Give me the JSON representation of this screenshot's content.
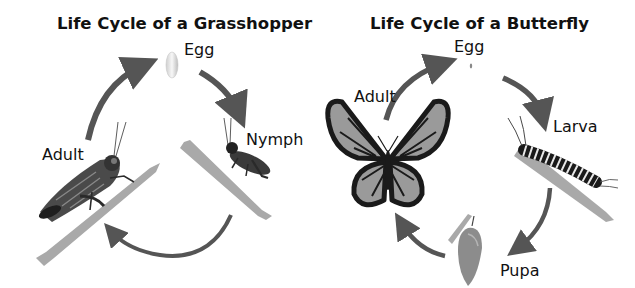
{
  "grasshopper": {
    "title": "Life Cycle of a Grasshopper",
    "stages": {
      "egg": "Egg",
      "nymph": "Nymph",
      "adult": "Adult"
    }
  },
  "butterfly": {
    "title": "Life Cycle of a Butterfly",
    "stages": {
      "egg": "Egg",
      "larva": "Larva",
      "pupa": "Pupa",
      "adult": "Adult"
    }
  },
  "colors": {
    "arrow": "#555555",
    "branch": "#a9a9a9",
    "wing": "#9a9a9a",
    "vein": "#1a1a1a"
  }
}
